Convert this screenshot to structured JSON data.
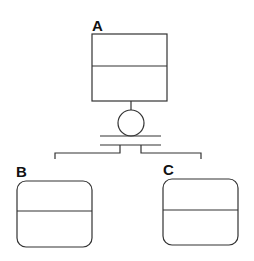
{
  "diagram": {
    "type": "hierarchy",
    "stroke_color": "#333333",
    "nodes": [
      {
        "id": "A",
        "label": "A",
        "shape": "rectangle",
        "compartments": 2
      },
      {
        "id": "B",
        "label": "B",
        "shape": "rounded-rectangle",
        "compartments": 2
      },
      {
        "id": "C",
        "label": "C",
        "shape": "rounded-rectangle",
        "compartments": 2
      }
    ],
    "connector": {
      "symbol": "circle-over-double-bar",
      "from": "A",
      "to": [
        "B",
        "C"
      ]
    }
  }
}
